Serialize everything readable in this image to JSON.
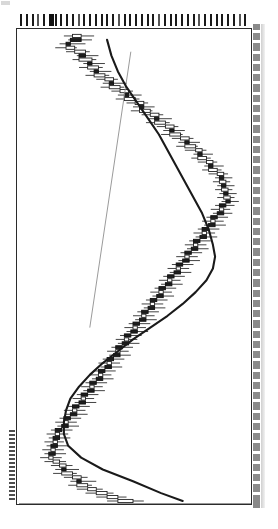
{
  "figure": {
    "orientation": "rotated-90",
    "background_color": "#ffffff",
    "frame_color": "#2b2b2b",
    "left_axis_label": "",
    "corner_mark": ""
  },
  "axes": {
    "top_axis_name": "date-axis-ticks",
    "top_tick_count": 40,
    "right_axis_name": "price-axis-ticks",
    "right_tick_count": 46,
    "tick_label_text": "",
    "labels_legible": false
  },
  "chart_data": {
    "type": "line",
    "subtype": "candlestick-rotated",
    "title": "",
    "subtitle": "",
    "xlabel": "",
    "ylabel": "",
    "legend": [],
    "grid": false,
    "legend_position": "none",
    "note": "Chart is rotated 90 degrees: the time axis runs vertically (top=earliest, bottom=latest) and the price axis runs horizontally (left=low, right=high). Values below are in normalized plot units: t = index along the time axis 0..119, price values 0..100 across the horizontal span.",
    "xlim": [
      0,
      119
    ],
    "ylim": [
      0,
      100
    ],
    "colors": {
      "up_body": "#ffffff",
      "down_body": "#1d1d1d",
      "wick": "#222222",
      "moving_average": "#1a1a1a",
      "trendline": "#8e8e8e"
    },
    "series": [
      {
        "name": "Moving Average",
        "type": "line",
        "points": [
          [
            2,
            38
          ],
          [
            6,
            40
          ],
          [
            10,
            43
          ],
          [
            14,
            47
          ],
          [
            18,
            52
          ],
          [
            22,
            57
          ],
          [
            26,
            62
          ],
          [
            30,
            66
          ],
          [
            34,
            70
          ],
          [
            38,
            74
          ],
          [
            42,
            78
          ],
          [
            46,
            82
          ],
          [
            50,
            85
          ],
          [
            54,
            87
          ],
          [
            57,
            88
          ],
          [
            60,
            87
          ],
          [
            63,
            84
          ],
          [
            66,
            79
          ],
          [
            69,
            73
          ],
          [
            72,
            66
          ],
          [
            75,
            58
          ],
          [
            78,
            50
          ],
          [
            81,
            43
          ],
          [
            84,
            36
          ],
          [
            87,
            30
          ],
          [
            90,
            25
          ],
          [
            93,
            21
          ],
          [
            96,
            19
          ],
          [
            99,
            18
          ],
          [
            102,
            18
          ],
          [
            105,
            20
          ],
          [
            108,
            26
          ],
          [
            111,
            36
          ],
          [
            114,
            50
          ],
          [
            117,
            63
          ],
          [
            119,
            73
          ]
        ]
      },
      {
        "name": "Trendline",
        "type": "line",
        "points": [
          [
            5,
            49
          ],
          [
            75,
            30
          ]
        ]
      },
      {
        "name": "Price",
        "type": "candlestick",
        "fields": [
          "t",
          "open",
          "high",
          "low",
          "close"
        ],
        "candles": [
          [
            1,
            22,
            32,
            18,
            26
          ],
          [
            2,
            26,
            31,
            20,
            21
          ],
          [
            3,
            21,
            28,
            16,
            19
          ],
          [
            4,
            19,
            24,
            14,
            23
          ],
          [
            5,
            23,
            30,
            19,
            28
          ],
          [
            6,
            28,
            34,
            24,
            25
          ],
          [
            7,
            25,
            33,
            22,
            31
          ],
          [
            8,
            31,
            37,
            27,
            29
          ],
          [
            9,
            29,
            36,
            25,
            34
          ],
          [
            10,
            34,
            40,
            30,
            32
          ],
          [
            11,
            32,
            39,
            28,
            37
          ],
          [
            12,
            37,
            43,
            33,
            41
          ],
          [
            13,
            41,
            47,
            36,
            39
          ],
          [
            14,
            39,
            46,
            35,
            44
          ],
          [
            15,
            44,
            50,
            40,
            48
          ],
          [
            16,
            48,
            54,
            43,
            46
          ],
          [
            17,
            46,
            53,
            42,
            51
          ],
          [
            18,
            51,
            57,
            47,
            55
          ],
          [
            19,
            55,
            60,
            50,
            53
          ],
          [
            20,
            53,
            59,
            49,
            58
          ],
          [
            21,
            58,
            64,
            54,
            62
          ],
          [
            22,
            62,
            68,
            57,
            60
          ],
          [
            23,
            60,
            67,
            56,
            65
          ],
          [
            24,
            65,
            71,
            61,
            69
          ],
          [
            25,
            69,
            74,
            64,
            67
          ],
          [
            26,
            67,
            73,
            63,
            72
          ],
          [
            27,
            72,
            78,
            68,
            76
          ],
          [
            28,
            76,
            81,
            71,
            74
          ],
          [
            29,
            74,
            80,
            70,
            79
          ],
          [
            30,
            79,
            84,
            74,
            82
          ],
          [
            31,
            82,
            87,
            78,
            80
          ],
          [
            32,
            80,
            86,
            77,
            84
          ],
          [
            33,
            84,
            89,
            80,
            87
          ],
          [
            34,
            87,
            92,
            83,
            85
          ],
          [
            35,
            85,
            91,
            82,
            89
          ],
          [
            36,
            89,
            94,
            85,
            92
          ],
          [
            37,
            92,
            96,
            88,
            90
          ],
          [
            38,
            90,
            95,
            87,
            93
          ],
          [
            39,
            93,
            97,
            89,
            91
          ],
          [
            40,
            91,
            96,
            88,
            94
          ],
          [
            41,
            94,
            98,
            90,
            92
          ],
          [
            42,
            92,
            97,
            89,
            95
          ],
          [
            43,
            95,
            99,
            91,
            93
          ],
          [
            44,
            93,
            97,
            88,
            90
          ],
          [
            45,
            90,
            95,
            86,
            92
          ],
          [
            46,
            92,
            96,
            87,
            89
          ],
          [
            47,
            89,
            94,
            84,
            86
          ],
          [
            48,
            86,
            92,
            82,
            88
          ],
          [
            49,
            88,
            93,
            83,
            85
          ],
          [
            50,
            85,
            90,
            80,
            82
          ],
          [
            51,
            82,
            88,
            78,
            84
          ],
          [
            52,
            84,
            89,
            79,
            81
          ],
          [
            53,
            81,
            86,
            76,
            78
          ],
          [
            54,
            78,
            84,
            74,
            80
          ],
          [
            55,
            80,
            85,
            75,
            77
          ],
          [
            56,
            77,
            82,
            72,
            74
          ],
          [
            57,
            74,
            80,
            70,
            76
          ],
          [
            58,
            76,
            81,
            71,
            73
          ],
          [
            59,
            73,
            78,
            68,
            70
          ],
          [
            60,
            70,
            76,
            66,
            72
          ],
          [
            61,
            72,
            77,
            67,
            69
          ],
          [
            62,
            69,
            74,
            64,
            66
          ],
          [
            63,
            66,
            72,
            62,
            68
          ],
          [
            64,
            68,
            73,
            63,
            65
          ],
          [
            65,
            65,
            70,
            60,
            62
          ],
          [
            66,
            62,
            68,
            58,
            64
          ],
          [
            67,
            64,
            69,
            59,
            61
          ],
          [
            68,
            61,
            66,
            56,
            58
          ],
          [
            69,
            58,
            64,
            54,
            60
          ],
          [
            70,
            60,
            65,
            55,
            57
          ],
          [
            71,
            57,
            62,
            52,
            54
          ],
          [
            72,
            54,
            60,
            50,
            56
          ],
          [
            73,
            56,
            61,
            51,
            53
          ],
          [
            74,
            53,
            58,
            48,
            50
          ],
          [
            75,
            50,
            56,
            46,
            52
          ],
          [
            76,
            52,
            57,
            47,
            49
          ],
          [
            77,
            49,
            54,
            44,
            46
          ],
          [
            78,
            46,
            52,
            42,
            48
          ],
          [
            79,
            48,
            53,
            43,
            45
          ],
          [
            80,
            45,
            50,
            40,
            42
          ],
          [
            81,
            42,
            48,
            38,
            44
          ],
          [
            82,
            44,
            49,
            39,
            41
          ],
          [
            83,
            41,
            46,
            36,
            38
          ],
          [
            84,
            38,
            44,
            34,
            40
          ],
          [
            85,
            40,
            45,
            35,
            37
          ],
          [
            86,
            37,
            42,
            32,
            34
          ],
          [
            87,
            34,
            40,
            30,
            36
          ],
          [
            88,
            36,
            41,
            31,
            33
          ],
          [
            89,
            33,
            38,
            28,
            30
          ],
          [
            90,
            30,
            36,
            26,
            32
          ],
          [
            91,
            32,
            37,
            27,
            29
          ],
          [
            92,
            29,
            34,
            24,
            26
          ],
          [
            93,
            26,
            32,
            22,
            28
          ],
          [
            94,
            28,
            33,
            23,
            25
          ],
          [
            95,
            25,
            30,
            20,
            22
          ],
          [
            96,
            22,
            28,
            18,
            24
          ],
          [
            97,
            24,
            29,
            19,
            21
          ],
          [
            98,
            21,
            26,
            16,
            18
          ],
          [
            99,
            18,
            24,
            14,
            20
          ],
          [
            100,
            20,
            25,
            15,
            17
          ],
          [
            101,
            17,
            22,
            12,
            14
          ],
          [
            102,
            14,
            20,
            10,
            16
          ],
          [
            103,
            16,
            21,
            11,
            13
          ],
          [
            104,
            13,
            18,
            9,
            15
          ],
          [
            105,
            15,
            20,
            10,
            12
          ],
          [
            106,
            12,
            18,
            8,
            14
          ],
          [
            107,
            14,
            19,
            9,
            11
          ],
          [
            108,
            11,
            17,
            7,
            13
          ],
          [
            109,
            13,
            19,
            9,
            16
          ],
          [
            110,
            16,
            22,
            12,
            19
          ],
          [
            111,
            19,
            25,
            14,
            17
          ],
          [
            112,
            17,
            24,
            13,
            22
          ],
          [
            113,
            22,
            29,
            18,
            26
          ],
          [
            114,
            26,
            33,
            21,
            24
          ],
          [
            115,
            24,
            31,
            20,
            29
          ],
          [
            116,
            29,
            36,
            24,
            33
          ],
          [
            117,
            33,
            41,
            28,
            38
          ],
          [
            118,
            38,
            47,
            33,
            43
          ],
          [
            119,
            43,
            55,
            38,
            50
          ]
        ]
      }
    ]
  }
}
